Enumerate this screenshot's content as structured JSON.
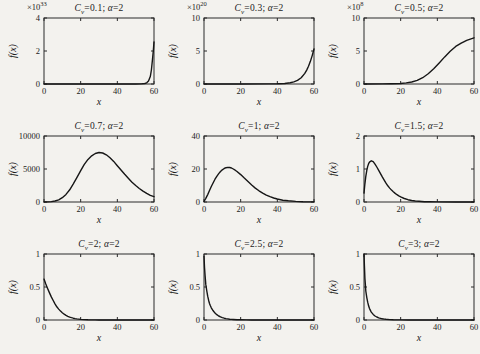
{
  "figure": {
    "background": "#f3f2ee",
    "axis_color": "#2a2a2a",
    "line_color": "#161616",
    "text_color": "#1b1b1b"
  },
  "chart_data": [
    {
      "type": "line",
      "cv": 0.1,
      "alpha": 2,
      "title_parts": [
        "C",
        "v",
        "=0.1; ",
        "α",
        "=2"
      ],
      "ylabel": "f(x)",
      "xlabel": "x",
      "y_scale": {
        "prefix": "×10",
        "exp": "33"
      },
      "xlim": [
        0,
        60
      ],
      "ylim": [
        0,
        4
      ],
      "xticks": [
        0,
        20,
        40,
        60
      ],
      "xtick_labels": [
        "0",
        "20",
        "40",
        "60"
      ],
      "yticks": [
        0,
        2,
        4
      ],
      "ytick_labels": [
        "0",
        "2",
        "4"
      ],
      "points": [
        [
          0,
          0
        ],
        [
          30,
          0
        ],
        [
          45,
          0
        ],
        [
          50,
          0.002
        ],
        [
          53,
          0.008
        ],
        [
          55,
          0.03
        ],
        [
          56,
          0.07
        ],
        [
          57,
          0.18
        ],
        [
          58,
          0.45
        ],
        [
          58.6,
          0.85
        ],
        [
          59.2,
          1.5
        ],
        [
          59.6,
          2.0
        ],
        [
          60,
          2.55
        ]
      ]
    },
    {
      "type": "line",
      "cv": 0.3,
      "alpha": 2,
      "title_parts": [
        "C",
        "v",
        "=0.3; ",
        "α",
        "=2"
      ],
      "ylabel": "f(x)",
      "xlabel": "x",
      "y_scale": {
        "prefix": "×10",
        "exp": "20"
      },
      "xlim": [
        0,
        60
      ],
      "ylim": [
        0,
        10
      ],
      "xticks": [
        0,
        20,
        40,
        60
      ],
      "xtick_labels": [
        "0",
        "20",
        "40",
        "60"
      ],
      "yticks": [
        0,
        5,
        10
      ],
      "ytick_labels": [
        "0",
        "5",
        "10"
      ],
      "points": [
        [
          0,
          0
        ],
        [
          20,
          0
        ],
        [
          35,
          0.01
        ],
        [
          40,
          0.03
        ],
        [
          44,
          0.08
        ],
        [
          47,
          0.18
        ],
        [
          49,
          0.32
        ],
        [
          51,
          0.55
        ],
        [
          53,
          0.95
        ],
        [
          55,
          1.6
        ],
        [
          56,
          2.1
        ],
        [
          57,
          2.7
        ],
        [
          58,
          3.4
        ],
        [
          59,
          4.3
        ],
        [
          60,
          5.3
        ]
      ]
    },
    {
      "type": "line",
      "cv": 0.5,
      "alpha": 2,
      "title_parts": [
        "C",
        "v",
        "=0.5; ",
        "α",
        "=2"
      ],
      "ylabel": "f(x)",
      "xlabel": "x",
      "y_scale": {
        "prefix": "×10",
        "exp": "8"
      },
      "xlim": [
        0,
        60
      ],
      "ylim": [
        0,
        10
      ],
      "xticks": [
        0,
        20,
        40,
        60
      ],
      "xtick_labels": [
        "0",
        "20",
        "40",
        "60"
      ],
      "yticks": [
        0,
        5,
        10
      ],
      "ytick_labels": [
        "0",
        "5",
        "10"
      ],
      "points": [
        [
          0,
          0
        ],
        [
          10,
          0.01
        ],
        [
          15,
          0.03
        ],
        [
          20,
          0.08
        ],
        [
          23,
          0.16
        ],
        [
          26,
          0.3
        ],
        [
          29,
          0.55
        ],
        [
          32,
          0.95
        ],
        [
          35,
          1.55
        ],
        [
          38,
          2.3
        ],
        [
          41,
          3.2
        ],
        [
          44,
          4.1
        ],
        [
          47,
          4.95
        ],
        [
          50,
          5.7
        ],
        [
          53,
          6.2
        ],
        [
          56,
          6.6
        ],
        [
          58,
          6.8
        ],
        [
          60,
          7.0
        ]
      ]
    },
    {
      "type": "line",
      "cv": 0.7,
      "alpha": 2,
      "title_parts": [
        "C",
        "v",
        "=0.7; ",
        "α",
        "=2"
      ],
      "ylabel": "f(x)",
      "xlabel": "x",
      "xlim": [
        0,
        60
      ],
      "ylim": [
        0,
        10000
      ],
      "xticks": [
        0,
        20,
        40,
        60
      ],
      "xtick_labels": [
        "0",
        "20",
        "40",
        "60"
      ],
      "yticks": [
        0,
        5000,
        10000
      ],
      "ytick_labels": [
        "0",
        "5000",
        "10000"
      ],
      "points": [
        [
          0,
          0
        ],
        [
          2,
          20
        ],
        [
          4,
          60
        ],
        [
          6,
          150
        ],
        [
          8,
          330
        ],
        [
          10,
          650
        ],
        [
          12,
          1150
        ],
        [
          14,
          1850
        ],
        [
          16,
          2750
        ],
        [
          18,
          3750
        ],
        [
          20,
          4750
        ],
        [
          22,
          5700
        ],
        [
          24,
          6450
        ],
        [
          26,
          7000
        ],
        [
          28,
          7350
        ],
        [
          30,
          7500
        ],
        [
          32,
          7420
        ],
        [
          34,
          7150
        ],
        [
          36,
          6700
        ],
        [
          38,
          6150
        ],
        [
          40,
          5500
        ],
        [
          42,
          4850
        ],
        [
          44,
          4200
        ],
        [
          46,
          3600
        ],
        [
          48,
          3000
        ],
        [
          50,
          2500
        ],
        [
          52,
          2050
        ],
        [
          54,
          1650
        ],
        [
          56,
          1300
        ],
        [
          58,
          1000
        ],
        [
          60,
          800
        ]
      ]
    },
    {
      "type": "line",
      "cv": 1,
      "alpha": 2,
      "title_parts": [
        "C",
        "v",
        "=1; ",
        "α",
        "=2"
      ],
      "ylabel": "f(x)",
      "xlabel": "x",
      "xlim": [
        0,
        60
      ],
      "ylim": [
        0,
        40
      ],
      "xticks": [
        0,
        20,
        40,
        60
      ],
      "xtick_labels": [
        "0",
        "20",
        "40",
        "60"
      ],
      "yticks": [
        0,
        20,
        40
      ],
      "ytick_labels": [
        "0",
        "20",
        "40"
      ],
      "points": [
        [
          0,
          0.3
        ],
        [
          1,
          2.2
        ],
        [
          2,
          4.5
        ],
        [
          3,
          7
        ],
        [
          4,
          9.4
        ],
        [
          5,
          11.7
        ],
        [
          6,
          13.8
        ],
        [
          7,
          15.6
        ],
        [
          8,
          17.2
        ],
        [
          9,
          18.5
        ],
        [
          10,
          19.5
        ],
        [
          11,
          20.3
        ],
        [
          12,
          20.8
        ],
        [
          13,
          21
        ],
        [
          14,
          20.9
        ],
        [
          15,
          20.6
        ],
        [
          16,
          20
        ],
        [
          17,
          19.3
        ],
        [
          18,
          18.5
        ],
        [
          20,
          16.6
        ],
        [
          22,
          14.5
        ],
        [
          24,
          12.4
        ],
        [
          26,
          10.3
        ],
        [
          28,
          8.4
        ],
        [
          30,
          6.8
        ],
        [
          32,
          5.4
        ],
        [
          34,
          4.2
        ],
        [
          36,
          3.2
        ],
        [
          38,
          2.4
        ],
        [
          40,
          1.8
        ],
        [
          43,
          1.1
        ],
        [
          46,
          0.7
        ],
        [
          50,
          0.35
        ],
        [
          54,
          0.15
        ],
        [
          60,
          0.05
        ]
      ]
    },
    {
      "type": "line",
      "cv": 1.5,
      "alpha": 2,
      "title_parts": [
        "C",
        "v",
        "=1.5; ",
        "α",
        "=2"
      ],
      "ylabel": "f(x)",
      "xlabel": "x",
      "xlim": [
        0,
        60
      ],
      "ylim": [
        0,
        2
      ],
      "xticks": [
        0,
        20,
        40,
        60
      ],
      "xtick_labels": [
        "0",
        "20",
        "40",
        "60"
      ],
      "yticks": [
        0,
        1,
        2
      ],
      "ytick_labels": [
        "0",
        "1",
        "2"
      ],
      "points": [
        [
          0,
          0.27
        ],
        [
          0.5,
          0.55
        ],
        [
          1,
          0.78
        ],
        [
          1.5,
          0.96
        ],
        [
          2,
          1.08
        ],
        [
          2.5,
          1.16
        ],
        [
          3,
          1.21
        ],
        [
          4,
          1.25
        ],
        [
          5,
          1.22
        ],
        [
          6,
          1.15
        ],
        [
          7,
          1.06
        ],
        [
          8,
          0.96
        ],
        [
          9,
          0.86
        ],
        [
          10,
          0.76
        ],
        [
          11,
          0.66
        ],
        [
          12,
          0.57
        ],
        [
          13,
          0.49
        ],
        [
          14,
          0.42
        ],
        [
          15,
          0.36
        ],
        [
          16,
          0.31
        ],
        [
          17,
          0.26
        ],
        [
          18,
          0.22
        ],
        [
          19,
          0.185
        ],
        [
          20,
          0.155
        ],
        [
          22,
          0.105
        ],
        [
          24,
          0.07
        ],
        [
          26,
          0.046
        ],
        [
          28,
          0.03
        ],
        [
          30,
          0.02
        ],
        [
          33,
          0.01
        ],
        [
          36,
          0.005
        ],
        [
          40,
          0.002
        ],
        [
          50,
          0.0005
        ],
        [
          60,
          0
        ]
      ]
    },
    {
      "type": "line",
      "cv": 2,
      "alpha": 2,
      "title_parts": [
        "C",
        "v",
        "=2; ",
        "α",
        "=2"
      ],
      "ylabel": "f(x)",
      "xlabel": "x",
      "xlim": [
        0,
        60
      ],
      "ylim": [
        0,
        1
      ],
      "xticks": [
        0,
        20,
        40,
        60
      ],
      "xtick_labels": [
        "0",
        "20",
        "40",
        "60"
      ],
      "yticks": [
        0,
        0.5,
        1
      ],
      "ytick_labels": [
        "0",
        "0.5",
        "1"
      ],
      "points": [
        [
          0,
          0.62
        ],
        [
          1,
          0.545
        ],
        [
          2,
          0.475
        ],
        [
          3,
          0.41
        ],
        [
          4,
          0.35
        ],
        [
          5,
          0.295
        ],
        [
          6,
          0.245
        ],
        [
          7,
          0.2
        ],
        [
          8,
          0.165
        ],
        [
          9,
          0.135
        ],
        [
          10,
          0.11
        ],
        [
          11,
          0.088
        ],
        [
          12,
          0.07
        ],
        [
          13,
          0.056
        ],
        [
          14,
          0.044
        ],
        [
          15,
          0.035
        ],
        [
          16,
          0.027
        ],
        [
          17,
          0.021
        ],
        [
          18,
          0.016
        ],
        [
          20,
          0.0095
        ],
        [
          22,
          0.0055
        ],
        [
          24,
          0.003
        ],
        [
          26,
          0.0017
        ],
        [
          28,
          0.001
        ],
        [
          30,
          0.0005
        ],
        [
          35,
          0.0002
        ],
        [
          40,
          0
        ],
        [
          60,
          0
        ]
      ]
    },
    {
      "type": "line",
      "cv": 2.5,
      "alpha": 2,
      "title_parts": [
        "C",
        "v",
        "=2.5; ",
        "α",
        "=2"
      ],
      "ylabel": "f(x)",
      "xlabel": "x",
      "xlim": [
        0,
        60
      ],
      "ylim": [
        0,
        1
      ],
      "xticks": [
        0,
        20,
        40,
        60
      ],
      "xtick_labels": [
        "0",
        "20",
        "40",
        "60"
      ],
      "yticks": [
        0,
        0.5,
        1
      ],
      "ytick_labels": [
        "0",
        "0.5",
        "1"
      ],
      "points": [
        [
          0,
          0.96
        ],
        [
          0.3,
          0.8
        ],
        [
          0.6,
          0.67
        ],
        [
          1,
          0.54
        ],
        [
          1.5,
          0.44
        ],
        [
          2,
          0.36
        ],
        [
          2.5,
          0.3
        ],
        [
          3,
          0.25
        ],
        [
          3.5,
          0.215
        ],
        [
          4,
          0.185
        ],
        [
          5,
          0.14
        ],
        [
          6,
          0.105
        ],
        [
          7,
          0.08
        ],
        [
          8,
          0.061
        ],
        [
          9,
          0.047
        ],
        [
          10,
          0.036
        ],
        [
          11,
          0.028
        ],
        [
          12,
          0.021
        ],
        [
          13,
          0.016
        ],
        [
          14,
          0.0125
        ],
        [
          15,
          0.0095
        ],
        [
          16,
          0.0073
        ],
        [
          18,
          0.0043
        ],
        [
          20,
          0.0025
        ],
        [
          23,
          0.0011
        ],
        [
          26,
          0.0005
        ],
        [
          30,
          0.0002
        ],
        [
          40,
          0
        ],
        [
          60,
          0
        ]
      ]
    },
    {
      "type": "line",
      "cv": 3,
      "alpha": 2,
      "title_parts": [
        "C",
        "v",
        "=3; ",
        "α",
        "=2"
      ],
      "ylabel": "f(x)",
      "xlabel": "x",
      "xlim": [
        0,
        60
      ],
      "ylim": [
        0,
        1
      ],
      "xticks": [
        0,
        20,
        40,
        60
      ],
      "xtick_labels": [
        "0",
        "20",
        "40",
        "60"
      ],
      "yticks": [
        0,
        0.5,
        1
      ],
      "ytick_labels": [
        "0",
        "0.5",
        "1"
      ],
      "points": [
        [
          0,
          1.0
        ],
        [
          0.2,
          0.83
        ],
        [
          0.5,
          0.63
        ],
        [
          0.8,
          0.51
        ],
        [
          1,
          0.44
        ],
        [
          1.5,
          0.34
        ],
        [
          2,
          0.27
        ],
        [
          2.5,
          0.215
        ],
        [
          3,
          0.175
        ],
        [
          3.5,
          0.145
        ],
        [
          4,
          0.12
        ],
        [
          5,
          0.085
        ],
        [
          6,
          0.061
        ],
        [
          7,
          0.045
        ],
        [
          8,
          0.033
        ],
        [
          9,
          0.025
        ],
        [
          10,
          0.018
        ],
        [
          11,
          0.014
        ],
        [
          12,
          0.01
        ],
        [
          14,
          0.006
        ],
        [
          16,
          0.0035
        ],
        [
          18,
          0.002
        ],
        [
          20,
          0.0012
        ],
        [
          24,
          0.0005
        ],
        [
          28,
          0.0002
        ],
        [
          35,
          0
        ],
        [
          60,
          0
        ]
      ]
    }
  ]
}
